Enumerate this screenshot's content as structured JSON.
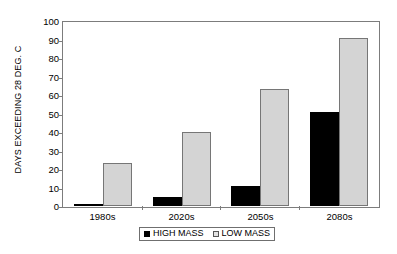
{
  "chart_data": {
    "type": "bar",
    "title": "",
    "subtitle": "",
    "xlabel": "",
    "ylabel": "DAYS EXCEEDING 28 DEG. C",
    "categories": [
      "1980s",
      "2020s",
      "2050s",
      "2080s"
    ],
    "series": [
      {
        "name": "HIGH MASS",
        "color": "#000000",
        "values": [
          1,
          5,
          11,
          51
        ]
      },
      {
        "name": "LOW MASS",
        "color": "#d4d4d4",
        "values": [
          23,
          40,
          63,
          91
        ]
      }
    ],
    "ylim": [
      0,
      100
    ],
    "yticks": [
      0,
      10,
      20,
      30,
      40,
      50,
      60,
      70,
      80,
      90,
      100
    ],
    "ytick_labels": [
      "0",
      "10",
      "20",
      "30",
      "40",
      "50",
      "60",
      "70",
      "80",
      "90",
      "100"
    ],
    "grid": false,
    "legend_position": "bottom",
    "legend_entries": [
      "HIGH MASS",
      "LOW MASS"
    ],
    "annotations": []
  }
}
